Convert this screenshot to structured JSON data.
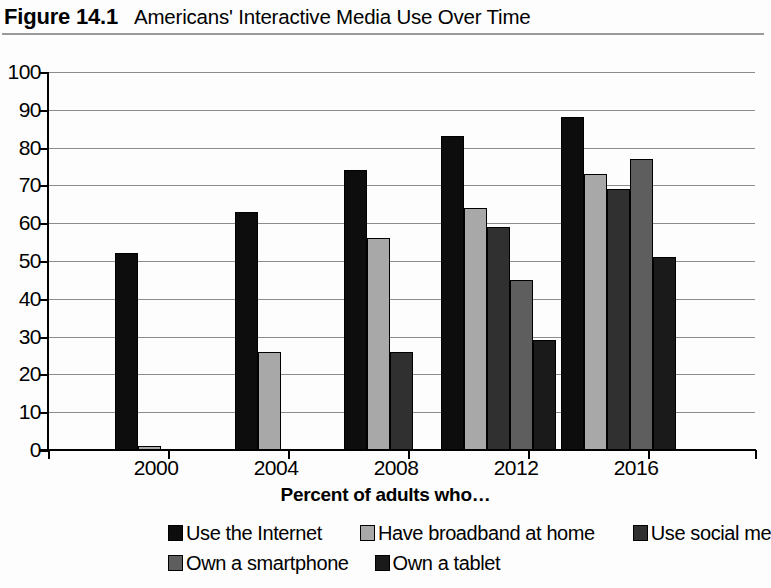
{
  "header": {
    "figure_number": "Figure 14.1",
    "title": "Americans' Interactive Media Use Over Time"
  },
  "chart_data": {
    "type": "bar",
    "title": "Americans' Interactive Media Use Over Time",
    "xlabel": "Percent of adults who…",
    "ylabel": "",
    "ylim": [
      0,
      100
    ],
    "ytick_step": 10,
    "grid": true,
    "legend_position": "bottom",
    "categories": [
      "2000",
      "2004",
      "2008",
      "2012",
      "2016"
    ],
    "ytick_labels": [
      "0",
      "10",
      "20",
      "30",
      "40",
      "50",
      "60",
      "70",
      "80",
      "90",
      "100"
    ],
    "series": [
      {
        "name": "Use the Internet",
        "color": "#0d0d0d",
        "values": [
          52,
          63,
          74,
          83,
          88
        ]
      },
      {
        "name": "Have broadband at home",
        "color": "#a8a8a8",
        "values": [
          1,
          26,
          56,
          64,
          73
        ]
      },
      {
        "name": "Use social media",
        "color": "#303030",
        "values": [
          null,
          null,
          26,
          59,
          69
        ]
      },
      {
        "name": "Own a smartphone",
        "color": "#5e5e5e",
        "values": [
          null,
          null,
          null,
          45,
          77
        ]
      },
      {
        "name": "Own a tablet",
        "color": "#1a1a1a",
        "values": [
          null,
          null,
          null,
          29,
          51
        ]
      }
    ]
  },
  "legend": {
    "row0": [
      "Use the Internet",
      "Have broadband at home",
      "Use social media"
    ],
    "row1": [
      "Own a smartphone",
      "Own a tablet"
    ]
  }
}
